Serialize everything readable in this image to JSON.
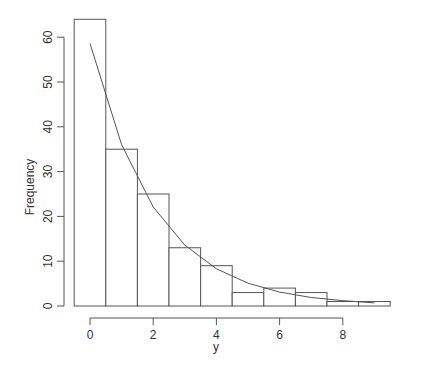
{
  "chart_data": {
    "type": "bar",
    "subtype": "histogram_with_density_curve",
    "title": "",
    "xlabel": "y",
    "ylabel": "Frequency",
    "bins": [
      {
        "from": -0.5,
        "to": 0.5,
        "count": 64
      },
      {
        "from": 0.5,
        "to": 1.5,
        "count": 35
      },
      {
        "from": 1.5,
        "to": 2.5,
        "count": 25
      },
      {
        "from": 2.5,
        "to": 3.5,
        "count": 13
      },
      {
        "from": 3.5,
        "to": 4.5,
        "count": 9
      },
      {
        "from": 4.5,
        "to": 5.5,
        "count": 3
      },
      {
        "from": 5.5,
        "to": 6.5,
        "count": 4
      },
      {
        "from": 6.5,
        "to": 7.5,
        "count": 3
      },
      {
        "from": 7.5,
        "to": 8.5,
        "count": 1
      },
      {
        "from": 8.5,
        "to": 9.5,
        "count": 1
      }
    ],
    "categories": [
      "0",
      "1",
      "2",
      "3",
      "4",
      "5",
      "6",
      "7",
      "8",
      "9"
    ],
    "values": [
      64,
      35,
      25,
      13,
      9,
      3,
      4,
      3,
      1,
      1
    ],
    "curve": {
      "name": "fitted expected frequency",
      "x": [
        0,
        1,
        2,
        3,
        4,
        5,
        6,
        7,
        8,
        9
      ],
      "y": [
        58.6,
        36.0,
        22.1,
        13.6,
        8.3,
        5.1,
        3.1,
        1.9,
        1.2,
        0.7
      ]
    },
    "xticks": [
      0,
      2,
      4,
      6,
      8
    ],
    "yticks": [
      0,
      10,
      20,
      30,
      40,
      50,
      60
    ],
    "xlim": [
      -0.5,
      9.5
    ],
    "ylim": [
      0,
      64
    ],
    "grid": false,
    "legend": null
  },
  "labels": {
    "xlabel": "y",
    "ylabel": "Frequency",
    "xticks": [
      "0",
      "2",
      "4",
      "6",
      "8"
    ],
    "yticks": [
      "0",
      "10",
      "20",
      "30",
      "40",
      "50",
      "60"
    ]
  }
}
